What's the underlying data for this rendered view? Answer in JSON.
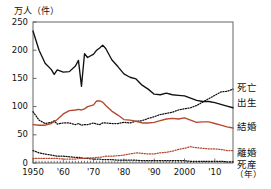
{
  "chart_data": {
    "type": "line",
    "title": "",
    "ylabel": "万人（件）",
    "xlabel": "（年）",
    "ylim": [
      0,
      250
    ],
    "xlim": [
      1950,
      2016
    ],
    "yticks": [
      0,
      50,
      100,
      150,
      200,
      250
    ],
    "ytick_labels": [
      "0",
      "50",
      "100",
      "150",
      "200",
      "250"
    ],
    "xticks": [
      1950,
      1960,
      1970,
      1980,
      1990,
      2000,
      2010
    ],
    "xtick_labels": [
      "1950",
      "'60",
      "'70",
      "'80",
      "'90",
      "2000",
      "'10"
    ],
    "grid": false,
    "legend_position": "right-outside",
    "x": [
      1950,
      1952,
      1954,
      1956,
      1957,
      1958,
      1960,
      1962,
      1964,
      1965,
      1966,
      1967,
      1968,
      1970,
      1971,
      1972,
      1973,
      1974,
      1976,
      1978,
      1980,
      1982,
      1984,
      1986,
      1988,
      1990,
      1992,
      1994,
      1996,
      1998,
      2000,
      2002,
      2004,
      2006,
      2008,
      2010,
      2012,
      2014,
      2016
    ],
    "series": [
      {
        "name": "出生",
        "label": "出生",
        "color": "#111111",
        "style": "solid",
        "values": [
          234,
          200,
          177,
          166,
          157,
          165,
          161,
          162,
          172,
          182,
          136,
          194,
          187,
          193,
          200,
          204,
          209,
          203,
          183,
          171,
          158,
          152,
          149,
          138,
          131,
          122,
          121,
          124,
          121,
          120,
          119,
          115,
          111,
          109,
          109,
          107,
          104,
          101,
          98
        ]
      },
      {
        "name": "死亡",
        "label": "死亡",
        "color": "#111111",
        "style": "dotted",
        "values": [
          91,
          76,
          70,
          72,
          75,
          69,
          71,
          71,
          68,
          70,
          67,
          68,
          68,
          71,
          69,
          68,
          71,
          71,
          70,
          70,
          72,
          71,
          74,
          75,
          79,
          82,
          86,
          88,
          90,
          94,
          96,
          98,
          102,
          108,
          114,
          120,
          126,
          127,
          131
        ]
      },
      {
        "name": "結婚",
        "label": "結婚",
        "color": "#b5482e",
        "style": "solid",
        "values": [
          68,
          67,
          67,
          70,
          73,
          77,
          87,
          93,
          94,
          95,
          94,
          96,
          100,
          103,
          110,
          110,
          108,
          102,
          92,
          85,
          77,
          76,
          74,
          71,
          71,
          72,
          75,
          78,
          79,
          78,
          80,
          76,
          72,
          73,
          73,
          70,
          67,
          64,
          62
        ]
      },
      {
        "name": "死産",
        "label": "死産",
        "color": "#111111",
        "style": "dotted",
        "values": [
          22,
          18,
          16,
          14,
          13,
          12,
          12,
          11,
          10,
          10,
          9,
          8,
          8,
          7,
          7,
          7,
          6,
          6,
          6,
          5,
          5,
          5,
          5,
          4,
          4,
          4,
          4,
          4,
          4,
          4,
          4,
          3,
          3,
          3,
          3,
          3,
          3,
          2,
          2
        ]
      },
      {
        "name": "離婚",
        "label": "離婚",
        "color": "#b5482e",
        "style": "dotted",
        "values": [
          8,
          8,
          8,
          8,
          8,
          8,
          7,
          7,
          7,
          8,
          8,
          8,
          9,
          9,
          10,
          10,
          11,
          12,
          12,
          13,
          14,
          16,
          18,
          17,
          16,
          16,
          18,
          19,
          21,
          24,
          26,
          29,
          27,
          26,
          25,
          25,
          24,
          22,
          22
        ]
      }
    ]
  },
  "axes": {
    "y_title": "万人（件）",
    "x_unit": "（年）"
  },
  "legend": [
    {
      "label": "死亡"
    },
    {
      "label": "出生"
    },
    {
      "label": "結婚"
    },
    {
      "label": "離婚"
    },
    {
      "label": "死産"
    }
  ]
}
